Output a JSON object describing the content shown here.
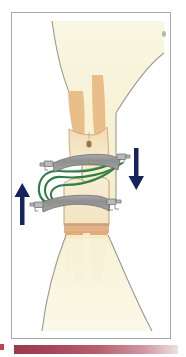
{
  "figure": {
    "title": "Orthodontic forced eruption diagram",
    "description": "Cross-section illustration of an upper and a lower tooth within alveolar bone, fitted with two orthodontic archwire bands joined by green elastic chains, with opposing vertical force arrows.",
    "background_color": "#ffffff",
    "panel": {
      "border_color": "#a8a8a8",
      "fill_color": "#ffffff"
    }
  },
  "anatomy": {
    "upper_bone": {
      "name": "Upper alveolar bone",
      "fill_color": "#f7f2d8",
      "outline_color": "#9c9a8e"
    },
    "lower_bone": {
      "name": "Lower alveolar bone",
      "fill_color": "#f8f4dc",
      "outline_color": "#9c9a8e"
    },
    "upper_tooth": {
      "name": "Upper tooth",
      "crown_color": "#f3e3c4",
      "root_color": "#e9bb84",
      "outline_color": "#c8a474",
      "lesion_color": "#8a6a2e",
      "lesion_label": "decay spot"
    },
    "lower_tooth": {
      "name": "Lower tooth",
      "crown_color": "#f6ecd2",
      "root_color": "#e7b47c",
      "outline_color": "#c09a68",
      "cervical_band_color": "#d9a679"
    }
  },
  "appliance": {
    "upper_band": {
      "name": "Upper archwire band",
      "fill_color": "#9b9b9b",
      "outline_color": "#6f6f6f"
    },
    "lower_band": {
      "name": "Lower archwire band",
      "fill_color": "#9b9b9b",
      "outline_color": "#6f6f6f"
    },
    "brackets": {
      "name": "Bracket hooks",
      "fill_color": "#b9b9b9",
      "outline_color": "#6d6d6d",
      "count": 4
    },
    "elastic_chain": {
      "name": "Elastic chain",
      "color": "#2f7d45",
      "highlight_color": "#4e9c62",
      "strand_count": 3
    }
  },
  "arrows": {
    "color": "#17235e",
    "items": [
      {
        "name": "extrusion-force-arrow",
        "direction": "up",
        "side": "left",
        "label": "upward force"
      },
      {
        "name": "intrusion-force-arrow",
        "direction": "down",
        "side": "right",
        "label": "downward force"
      }
    ]
  },
  "markers": {
    "corner_dot": {
      "name": "corner registration dot",
      "color": "#9d9d9d"
    }
  },
  "footer": {
    "bar_start_color": "#9a3a4c",
    "bar_end_color": "#efdfe2",
    "tick_color": "#c24050"
  }
}
